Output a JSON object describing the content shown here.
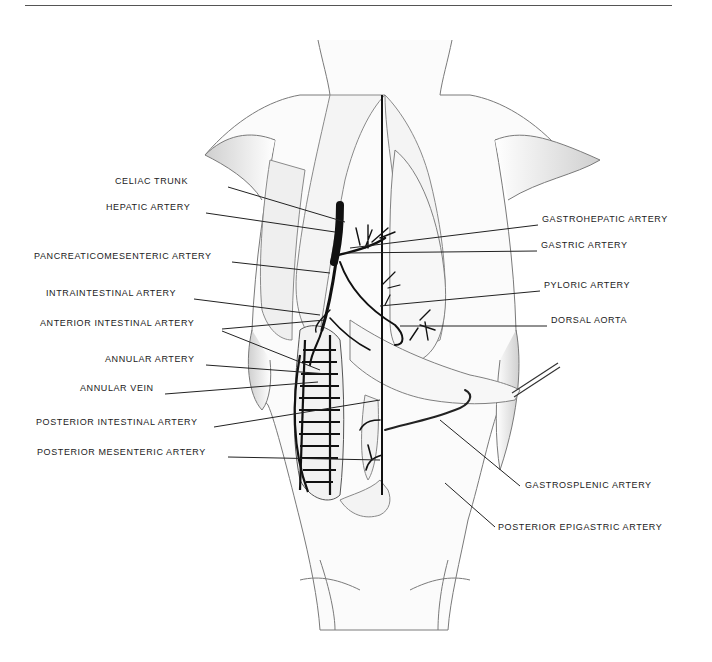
{
  "figure": {
    "labels_left": [
      {
        "id": "celiac-trunk",
        "text": "CELIAC TRUNK",
        "x": 115,
        "y": 181,
        "anchor_x": 345,
        "anchor_y": 222
      },
      {
        "id": "hepatic-artery",
        "text": "HEPATIC ARTERY",
        "x": 106,
        "y": 207,
        "anchor_x": 335,
        "anchor_y": 232
      },
      {
        "id": "pancreaticomesenteric-artery",
        "text": "PANCREATICOMESENTERIC ARTERY",
        "x": 34,
        "y": 256,
        "anchor_x": 330,
        "anchor_y": 273
      },
      {
        "id": "intraintestinal-artery",
        "text": "INTRAINTESTINAL ARTERY",
        "x": 46,
        "y": 293,
        "anchor_x": 320,
        "anchor_y": 315
      },
      {
        "id": "anterior-intestinal-artery",
        "text": "ANTERIOR INTESTINAL ARTERY",
        "x": 40,
        "y": 323,
        "anchor_x": 325,
        "anchor_y": 320,
        "anchor2_x": 320,
        "anchor2_y": 370
      },
      {
        "id": "annular-artery",
        "text": "ANNULAR ARTERY",
        "x": 105,
        "y": 359,
        "anchor_x": 328,
        "anchor_y": 374
      },
      {
        "id": "annular-vein",
        "text": "ANNULAR VEIN",
        "x": 80,
        "y": 388,
        "anchor_x": 318,
        "anchor_y": 382
      },
      {
        "id": "posterior-intestinal-artery",
        "text": "POSTERIOR INTESTINAL ARTERY",
        "x": 36,
        "y": 422,
        "anchor_x": 380,
        "anchor_y": 400
      },
      {
        "id": "posterior-mesenteric-artery",
        "text": "POSTERIOR MESENTERIC ARTERY",
        "x": 37,
        "y": 452,
        "anchor_x": 380,
        "anchor_y": 460
      }
    ],
    "labels_right": [
      {
        "id": "gastrohepatic-artery",
        "text": "GASTROHEPATIC ARTERY",
        "x": 542,
        "y": 219,
        "anchor_x": 350,
        "anchor_y": 248
      },
      {
        "id": "gastric-artery",
        "text": "GASTRIC ARTERY",
        "x": 541,
        "y": 245,
        "anchor_x": 345,
        "anchor_y": 253
      },
      {
        "id": "pyloric-artery",
        "text": "PYLORIC ARTERY",
        "x": 544,
        "y": 285,
        "anchor_x": 380,
        "anchor_y": 306
      },
      {
        "id": "dorsal-aorta",
        "text": "DORSAL AORTA",
        "x": 551,
        "y": 320,
        "anchor_x": 400,
        "anchor_y": 326
      },
      {
        "id": "gastrosplenic-artery",
        "text": "GASTROSPLENIC ARTERY",
        "x": 525,
        "y": 485,
        "anchor_x": 440,
        "anchor_y": 420
      },
      {
        "id": "posterior-epigastric-artery",
        "text": "POSTERIOR EPIGASTRIC ARTERY",
        "x": 498,
        "y": 527,
        "anchor_x": 445,
        "anchor_y": 483
      }
    ],
    "colors": {
      "ink": "#222222",
      "vessel": "#111111",
      "outline": "#7a7a7a",
      "shade": "#d9d9d9",
      "rule": "#555555"
    }
  }
}
